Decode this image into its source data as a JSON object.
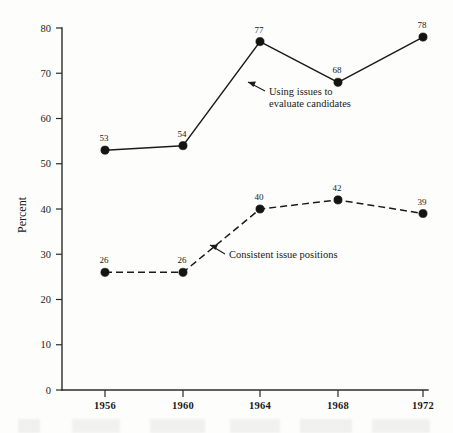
{
  "chart_data": {
    "type": "line",
    "title": "",
    "subtitle": "",
    "xlabel": "",
    "ylabel": "Percent",
    "categories": [
      "1956",
      "1960",
      "1964",
      "1968",
      "1972"
    ],
    "x": [
      1956,
      1960,
      1964,
      1968,
      1972
    ],
    "xlim": [
      1954,
      1974
    ],
    "ylim": [
      0,
      80
    ],
    "yticks": [
      0,
      10,
      20,
      30,
      40,
      50,
      60,
      70,
      80
    ],
    "ytick_labels": [
      "0",
      "10",
      "20",
      "30",
      "40",
      "50",
      "60",
      "70",
      "80"
    ],
    "xtick_labels": [
      "1956",
      "1960",
      "1964",
      "1968",
      "1972"
    ],
    "grid": false,
    "legend": "inline-annotations",
    "series": [
      {
        "name": "Using issues to evaluate candidates",
        "values": [
          53,
          54,
          77,
          68,
          78
        ],
        "value_labels": [
          "53",
          "54",
          "77",
          "68",
          "78"
        ],
        "line_style": "solid",
        "marker": "filled-circle",
        "color": "#1b1b1b"
      },
      {
        "name": "Consistent issue positions",
        "values": [
          26,
          26,
          40,
          42,
          39
        ],
        "value_labels": [
          "26",
          "26",
          "40",
          "42",
          "39"
        ],
        "line_style": "dashed",
        "marker": "filled-circle",
        "color": "#1b1b1b"
      }
    ],
    "annotations": [
      {
        "id": "annot-upper",
        "text_line1": "Using issues to",
        "text_line2": "evaluate candidates",
        "points_to_series": "Using issues to evaluate candidates"
      },
      {
        "id": "annot-lower",
        "text_line1": "Consistent issue positions",
        "text_line2": "",
        "points_to_series": "Consistent issue positions"
      }
    ]
  },
  "style": {
    "background": "#fdfdfb",
    "ink": "#1b1b1b",
    "axis": "#2b2b2b"
  }
}
